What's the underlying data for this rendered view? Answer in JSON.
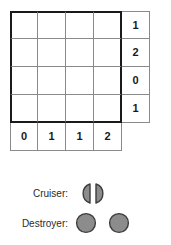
{
  "puzzle": {
    "type": "battleships-grid",
    "grid_size": {
      "rows": 4,
      "cols": 4
    },
    "row_clues": [
      "1",
      "2",
      "0",
      "1"
    ],
    "col_clues": [
      "0",
      "1",
      "1",
      "2"
    ],
    "cells": [
      [
        "",
        "",
        "",
        ""
      ],
      [
        "",
        "",
        "",
        ""
      ],
      [
        "",
        "",
        "",
        ""
      ],
      [
        "",
        "",
        "",
        ""
      ]
    ],
    "colors": {
      "grid_line": "#8a8a8a",
      "outer_border": "#1a1a1a",
      "ship_fill": "#8c8c8c",
      "ship_stroke": "#3d3d3d",
      "background": "#ffffff"
    }
  },
  "legend": {
    "items": [
      {
        "label": "Cruiser:",
        "shapes": [
          "half-circle-left",
          "half-circle-right"
        ],
        "segments": 2
      },
      {
        "label": "Destroyer:",
        "shapes": [
          "circle",
          "circle"
        ],
        "segments": 2
      }
    ]
  }
}
